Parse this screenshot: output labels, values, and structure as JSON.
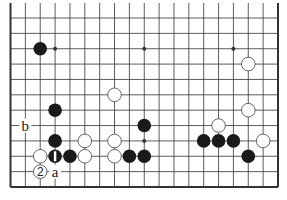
{
  "diagram": {
    "type": "go-board-fragment",
    "columns": 19,
    "rows": 12,
    "open_top": true,
    "colors": {
      "line": "#333333",
      "edge": "#333333",
      "black": "#1a1a1a",
      "white": "#ffffff",
      "white_stroke": "#555555",
      "background": "#ffffff"
    },
    "star_points": [
      [
        3,
        2
      ],
      [
        9,
        2
      ],
      [
        15,
        2
      ],
      [
        9,
        8
      ]
    ],
    "stones": [
      {
        "col": 2,
        "row": 2,
        "color": "black"
      },
      {
        "col": 16,
        "row": 3,
        "color": "white"
      },
      {
        "col": 7,
        "row": 5,
        "color": "white"
      },
      {
        "col": 16,
        "row": 6,
        "color": "white"
      },
      {
        "col": 3,
        "row": 6,
        "color": "black"
      },
      {
        "col": 9,
        "row": 7,
        "color": "black"
      },
      {
        "col": 14,
        "row": 7,
        "color": "white"
      },
      {
        "col": 3,
        "row": 8,
        "color": "black"
      },
      {
        "col": 5,
        "row": 8,
        "color": "white"
      },
      {
        "col": 7,
        "row": 8,
        "color": "white"
      },
      {
        "col": 13,
        "row": 8,
        "color": "black"
      },
      {
        "col": 14,
        "row": 8,
        "color": "black"
      },
      {
        "col": 15,
        "row": 8,
        "color": "black"
      },
      {
        "col": 17,
        "row": 8,
        "color": "white"
      },
      {
        "col": 2,
        "row": 9,
        "color": "white"
      },
      {
        "col": 3,
        "row": 9,
        "color": "black",
        "label": "1"
      },
      {
        "col": 4,
        "row": 9,
        "color": "black"
      },
      {
        "col": 5,
        "row": 9,
        "color": "white"
      },
      {
        "col": 7,
        "row": 9,
        "color": "white"
      },
      {
        "col": 8,
        "row": 9,
        "color": "black"
      },
      {
        "col": 9,
        "row": 9,
        "color": "black"
      },
      {
        "col": 16,
        "row": 9,
        "color": "black"
      },
      {
        "col": 2,
        "row": 10,
        "color": "white",
        "label": "2"
      }
    ],
    "letters": [
      {
        "col": 1,
        "row": 7,
        "text": "b"
      },
      {
        "col": 3,
        "row": 10,
        "text": "a"
      }
    ]
  }
}
